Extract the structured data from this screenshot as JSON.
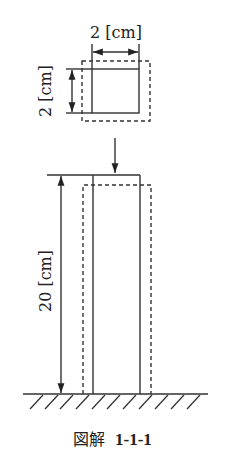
{
  "diagram": {
    "cross_section": {
      "width_label": "2 [cm]",
      "height_label": "2 [cm]"
    },
    "column": {
      "length_label": "20 [cm]"
    },
    "load_arrow": "compressive-load-arrow",
    "ground": "fixed-ground-hatching",
    "caption": {
      "prefix": "図解",
      "number": "1-1-1"
    },
    "colors": {
      "line": "#333333",
      "text": "#222222",
      "background": "#ffffff"
    }
  }
}
